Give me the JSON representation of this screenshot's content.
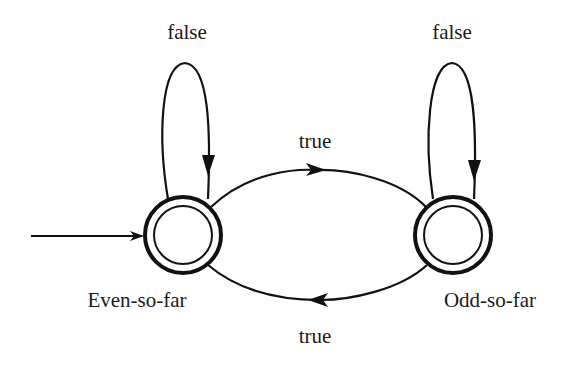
{
  "diagram": {
    "type": "finite-state-machine",
    "stroke_color": "#111111",
    "background": "#ffffff",
    "states": [
      {
        "id": "even",
        "label": "Even-so-far",
        "accepting": true,
        "initial": true
      },
      {
        "id": "odd",
        "label": "Odd-so-far",
        "accepting": true,
        "initial": false
      }
    ],
    "transitions": [
      {
        "from": "even",
        "to": "even",
        "label": "false"
      },
      {
        "from": "odd",
        "to": "odd",
        "label": "false"
      },
      {
        "from": "even",
        "to": "odd",
        "label": "true"
      },
      {
        "from": "odd",
        "to": "even",
        "label": "true"
      }
    ]
  }
}
